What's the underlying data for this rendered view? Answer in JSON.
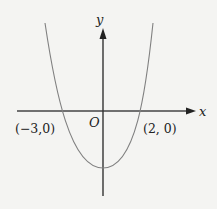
{
  "diagram": {
    "type": "parabola-graph",
    "axes": {
      "x_label": "x",
      "y_label": "y",
      "origin_label": "O"
    },
    "points": [
      {
        "label": "(−3,0)",
        "x": -3,
        "y": 0
      },
      {
        "label": "(2, 0)",
        "x": 2,
        "y": 0
      }
    ],
    "curve": {
      "shape": "upward-opening parabola",
      "roots": [
        -3,
        2
      ]
    },
    "colors": {
      "background": "#f4f4f2",
      "axis": "#333333",
      "curve": "#777777",
      "text": "#222222"
    }
  }
}
